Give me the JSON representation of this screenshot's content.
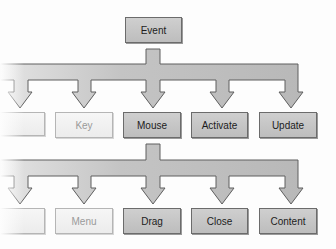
{
  "diagram": {
    "type": "hierarchy",
    "root": {
      "label": "Event"
    },
    "level1": [
      {
        "label": "",
        "faded": true,
        "partial": true
      },
      {
        "label": "Key",
        "faded": true
      },
      {
        "label": "Mouse",
        "faded": false
      },
      {
        "label": "Activate",
        "faded": false
      },
      {
        "label": "Update",
        "faded": false
      }
    ],
    "level2_parent": "Mouse",
    "level2": [
      {
        "label": "",
        "faded": true,
        "partial": true
      },
      {
        "label": "Menu",
        "faded": true
      },
      {
        "label": "Drag",
        "faded": false
      },
      {
        "label": "Close",
        "faded": false
      },
      {
        "label": "Content",
        "faded": false
      }
    ],
    "colors": {
      "box_fill": "#c6c6c6",
      "box_faded_fill": "#f0f0f0",
      "arrow_fill": "#bcbcbc",
      "outline": "#6b6b6b",
      "background": "#fdfdfd"
    }
  }
}
